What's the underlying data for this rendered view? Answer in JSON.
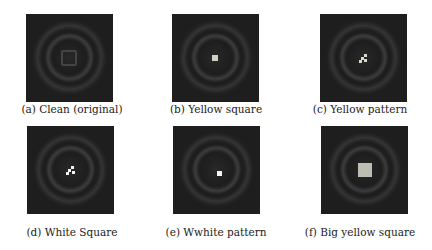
{
  "figure": {
    "panels": [
      {
        "id": "a",
        "caption": "(a) Clean (original)",
        "trigger": "none"
      },
      {
        "id": "b",
        "caption": "(b) Yellow square",
        "trigger": "small-square",
        "trigger_color": "#cfcfc4"
      },
      {
        "id": "c",
        "caption": "(c) Yellow pattern",
        "trigger": "pattern",
        "trigger_color": "#d8d8cc"
      },
      {
        "id": "d",
        "caption": "(d) White Square",
        "trigger": "pattern",
        "trigger_color": "#f2f2f2"
      },
      {
        "id": "e",
        "caption": "(e) Wwhite pattern",
        "trigger": "small-square",
        "trigger_color": "#f4f4f4"
      },
      {
        "id": "f",
        "caption": "(f) Big yellow square",
        "trigger": "big-square",
        "trigger_color": "#bdbdb4"
      }
    ],
    "image_background": "#1e1e1e"
  }
}
